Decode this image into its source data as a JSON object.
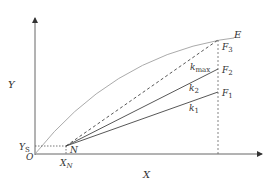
{
  "diagram": {
    "axes": {
      "x_label": "X",
      "y_label": "Y",
      "origin_label": "O"
    },
    "points": {
      "N": {
        "label": "N"
      },
      "E": {
        "label": "E"
      },
      "F1": {
        "label": "F",
        "sub": "1"
      },
      "F2": {
        "label": "F",
        "sub": "2"
      },
      "F3": {
        "label": "F",
        "sub": "3"
      }
    },
    "ticks": {
      "y_s": {
        "label": "Y",
        "sub": "S"
      },
      "x_n": {
        "label": "X",
        "sub": "N"
      }
    },
    "lines": {
      "k1": {
        "label": "k",
        "sub": "1"
      },
      "k2": {
        "label": "k",
        "sub": "2"
      },
      "kmax": {
        "label": "k",
        "sub": "max"
      }
    },
    "colors": {
      "axis": "#555555",
      "curve": "#9a9a9a",
      "solid_lines": "#444444",
      "dashed": "#555555"
    }
  }
}
